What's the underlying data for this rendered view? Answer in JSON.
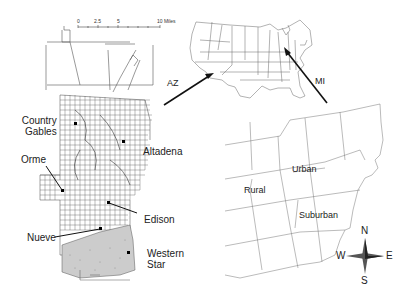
{
  "figure": {
    "panels": {
      "az_city": {
        "scale_bar": {
          "ticks": [
            "0",
            "2.5",
            "5",
            "10 Miles"
          ]
        },
        "places": [
          {
            "name": "Country Gables",
            "line1": "Country",
            "line2": "Gables"
          },
          {
            "name": "Altadena"
          },
          {
            "name": "Orme"
          },
          {
            "name": "Edison"
          },
          {
            "name": "Nueve"
          },
          {
            "name": "Western Star",
            "line1": "Western",
            "line2": "Star"
          }
        ]
      },
      "us_map": {
        "state_labels": [
          "AZ",
          "MI"
        ]
      },
      "mi_counties": {
        "region_labels": [
          "Urban",
          "Rural",
          "Suburban"
        ],
        "compass": {
          "N": "N",
          "S": "S",
          "E": "E",
          "W": "W"
        }
      }
    },
    "colors": {
      "line": "#444444",
      "arrow": "#111111",
      "background": "#ffffff"
    }
  }
}
